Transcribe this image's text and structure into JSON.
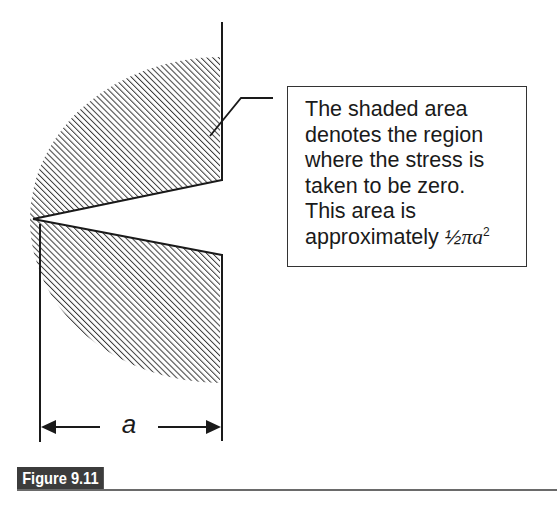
{
  "diagram": {
    "type": "crack-tip plastic zone schematic",
    "shaded_region_label": "zero-stress region",
    "dimension": {
      "label": "a",
      "arrows": "both"
    },
    "colors": {
      "line": "#1a1a1a",
      "hatch": "#3a3a3a",
      "background": "#ffffff"
    }
  },
  "callout": {
    "lines": [
      "The shaded area",
      "denotes the region",
      "where the stress is",
      "taken to be zero.",
      "This area is",
      "approximately"
    ],
    "formula": {
      "fraction": "½",
      "symbol": "π",
      "variable": "a",
      "exponent": "2"
    }
  },
  "figure": {
    "label": "Figure 9.11",
    "label_bg": "#3c3c3c",
    "label_color": "#ffffff"
  }
}
